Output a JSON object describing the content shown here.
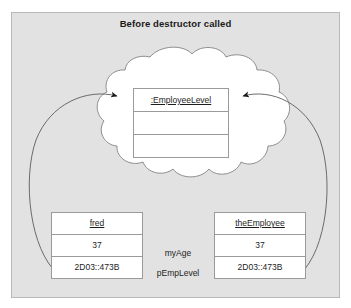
{
  "figure": {
    "title": "Before destructor called",
    "frame_color": "#e2e2e2",
    "ink_color": "#1d1d1d",
    "box_border_color": "#9a9a9a",
    "arrow_color": "#555555"
  },
  "heap": {
    "shape_name": "cloud",
    "object": {
      "header": ":EmployeeLevel",
      "rows": [
        "",
        ""
      ]
    }
  },
  "stack": {
    "left_object": {
      "header": "fred",
      "rows": [
        "37",
        "2D03::473B"
      ]
    },
    "right_object": {
      "header": "theEmployee",
      "rows": [
        "37",
        "2D03::473B"
      ]
    },
    "member_labels": {
      "age": "myAge",
      "pointer": "pEmpLevel"
    }
  },
  "arrows": [
    {
      "name": "fred-to-heap-object",
      "from": "fred.pEmpLevel",
      "to": ":EmployeeLevel"
    },
    {
      "name": "theEmployee-to-heap-object",
      "from": "theEmployee.pEmpLevel",
      "to": ":EmployeeLevel"
    }
  ]
}
